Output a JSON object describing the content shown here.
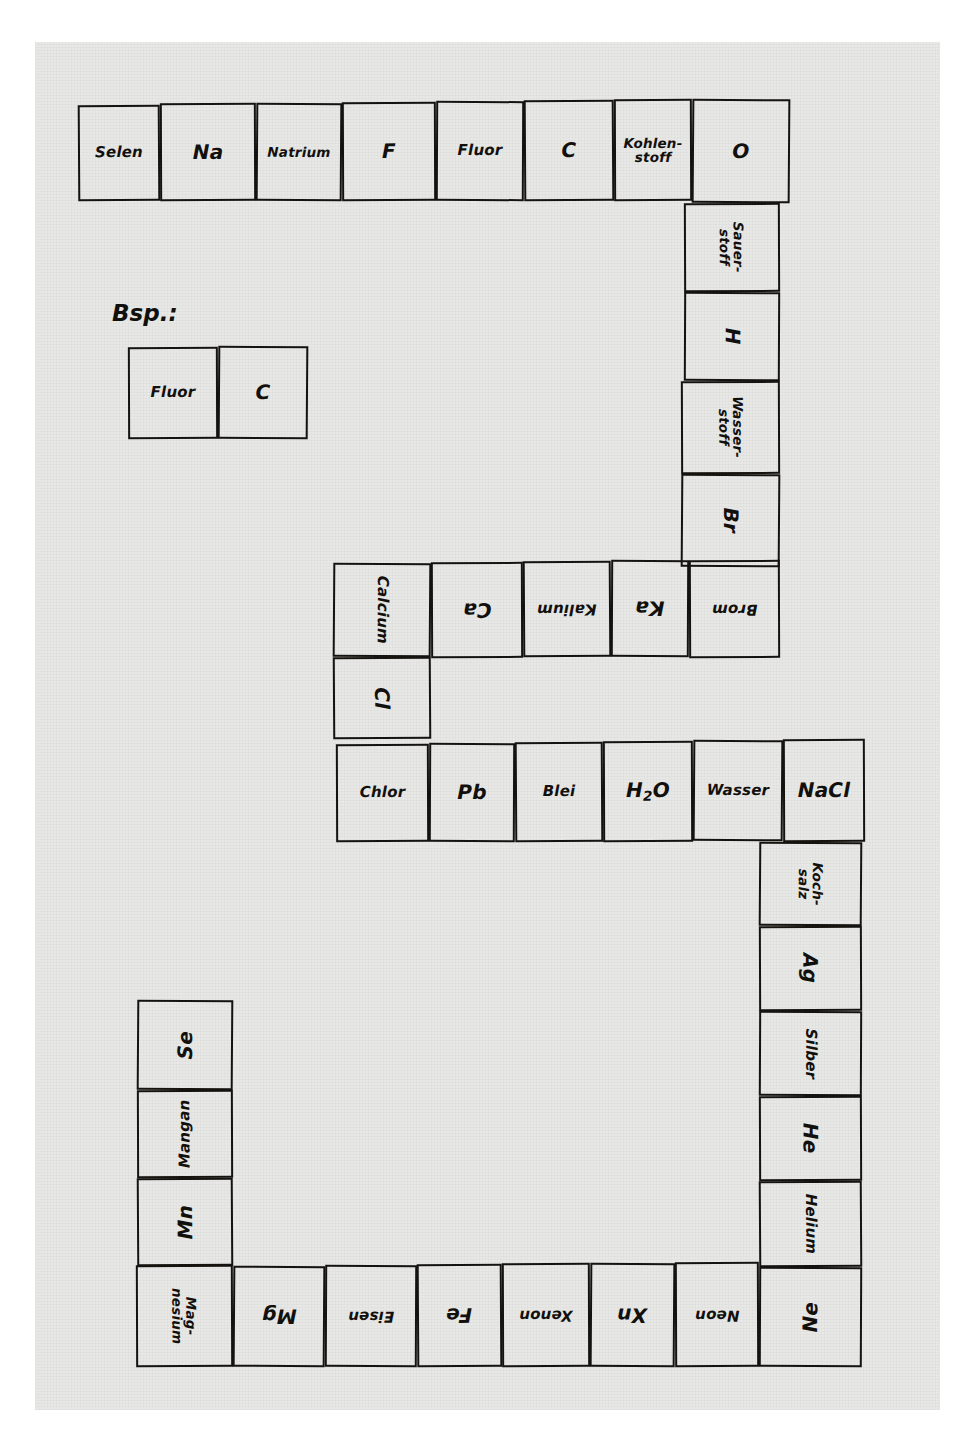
{
  "worksheet": {
    "title": "Chemie-Domino: Elementsymbole und Namen",
    "language": "de",
    "example_label": "Bsp.:",
    "ink_color": "#12100d",
    "paper_color": "#e8e8e6",
    "page_background": "#ffffff"
  },
  "example": {
    "name": "example-domino",
    "cells": [
      {
        "text": "Fluor",
        "rotation": 0
      },
      {
        "text": "C",
        "rotation": 0
      }
    ]
  },
  "chains": [
    {
      "name": "top-row",
      "orientation": "horizontal",
      "cells": [
        {
          "text": "Selen",
          "rotation": 0,
          "size": "small"
        },
        {
          "text": "Na",
          "rotation": 0,
          "size": "normal"
        },
        {
          "text": "Natrium",
          "rotation": 0,
          "size": "xsmall"
        },
        {
          "text": "F",
          "rotation": 0,
          "size": "normal"
        },
        {
          "text": "Fluor",
          "rotation": 0,
          "size": "small"
        },
        {
          "text": "C",
          "rotation": 0,
          "size": "normal"
        },
        {
          "text": "Kohlen-\nstoff",
          "rotation": 0,
          "size": "xsmall"
        },
        {
          "text": "O",
          "rotation": 0,
          "size": "normal"
        }
      ]
    },
    {
      "name": "right-upper-column",
      "orientation": "vertical",
      "cells": [
        {
          "text": "Sauer-\nstoff",
          "rotation": 90,
          "size": "xsmall"
        },
        {
          "text": "H",
          "rotation": 90,
          "size": "normal"
        },
        {
          "text": "Wasser-\nstoff",
          "rotation": 90,
          "size": "xsmall"
        },
        {
          "text": "Br",
          "rotation": 90,
          "size": "normal"
        }
      ]
    },
    {
      "name": "middle-row",
      "orientation": "horizontal",
      "cells": [
        {
          "text": "Calcium",
          "rotation": 90,
          "size": "small"
        },
        {
          "text": "Ca",
          "rotation": 180,
          "size": "normal"
        },
        {
          "text": "Kalium",
          "rotation": 180,
          "size": "small"
        },
        {
          "text": "Ka",
          "rotation": 180,
          "size": "normal"
        },
        {
          "text": "Brom",
          "rotation": 180,
          "size": "small"
        }
      ]
    },
    {
      "name": "calcium-chlor-link",
      "orientation": "vertical",
      "cells": [
        {
          "text": "Cl",
          "rotation": 90,
          "size": "normal"
        }
      ]
    },
    {
      "name": "lower-middle-row",
      "orientation": "horizontal",
      "cells": [
        {
          "text": "Chlor",
          "rotation": 0,
          "size": "small"
        },
        {
          "text": "Pb",
          "rotation": 0,
          "size": "normal"
        },
        {
          "text": "Blei",
          "rotation": 0,
          "size": "small"
        },
        {
          "text": "H2O",
          "rotation": 0,
          "size": "normal",
          "formula": true
        },
        {
          "text": "Wasser",
          "rotation": 0,
          "size": "small"
        },
        {
          "text": "NaCl",
          "rotation": 0,
          "size": "normal"
        }
      ]
    },
    {
      "name": "right-lower-column",
      "orientation": "vertical",
      "cells": [
        {
          "text": "Koch-\nsalz",
          "rotation": 90,
          "size": "xsmall"
        },
        {
          "text": "Ag",
          "rotation": 90,
          "size": "normal"
        },
        {
          "text": "Silber",
          "rotation": 90,
          "size": "small"
        },
        {
          "text": "He",
          "rotation": 90,
          "size": "normal"
        },
        {
          "text": "Helium",
          "rotation": 90,
          "size": "small"
        }
      ]
    },
    {
      "name": "bottom-row",
      "orientation": "horizontal",
      "cells": [
        {
          "text": "Mag-\nnesium",
          "rotation": 90,
          "size": "xsmall"
        },
        {
          "text": "Mg",
          "rotation": 180,
          "size": "normal"
        },
        {
          "text": "Eisen",
          "rotation": 180,
          "size": "small"
        },
        {
          "text": "Fe",
          "rotation": 180,
          "size": "normal"
        },
        {
          "text": "Xenon",
          "rotation": 180,
          "size": "small"
        },
        {
          "text": "Xn",
          "rotation": 180,
          "size": "normal"
        },
        {
          "text": "Neon",
          "rotation": 180,
          "size": "small"
        },
        {
          "text": "Ne",
          "rotation": 270,
          "size": "normal"
        }
      ]
    },
    {
      "name": "left-column",
      "orientation": "vertical",
      "cells": [
        {
          "text": "Se",
          "rotation": 270,
          "size": "normal"
        },
        {
          "text": "Mangan",
          "rotation": 270,
          "size": "small"
        },
        {
          "text": "Mn",
          "rotation": 270,
          "size": "normal"
        }
      ]
    }
  ]
}
